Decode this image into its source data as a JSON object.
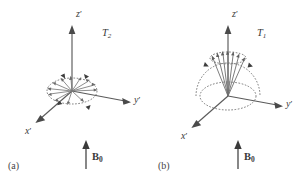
{
  "figure": {
    "width": 308,
    "height": 184,
    "background": "#ffffff",
    "ink_color": "#4a4a4a"
  },
  "panels": [
    {
      "id": "a",
      "panel_label": "(a)",
      "relaxation_label": "T",
      "relaxation_subscript": "2",
      "field_label": "B",
      "field_subscript": "0",
      "axes": [
        {
          "name": "z-prime",
          "base": "z",
          "prime": "′"
        },
        {
          "name": "y-prime",
          "base": "y",
          "prime": "′"
        },
        {
          "name": "x-prime",
          "base": "x",
          "prime": "′"
        }
      ],
      "description": "Transverse dephasing: spin isochromats fanned out in the x'y' plane inside a dashed ellipse, with curved rotation arrowheads on the ellipse rim.",
      "spin_count": 12,
      "rotation_arrowheads": 4
    },
    {
      "id": "b",
      "panel_label": "(b)",
      "relaxation_label": "T",
      "relaxation_subscript": "1",
      "field_label": "B",
      "field_subscript": "0",
      "axes": [
        {
          "name": "z-prime",
          "base": "z",
          "prime": "′"
        },
        {
          "name": "y-prime",
          "base": "y",
          "prime": "′"
        },
        {
          "name": "x-prime",
          "base": "x",
          "prime": "′"
        }
      ],
      "description": "Longitudinal recovery: bundle of spin vectors collapsing into a cone about z', dashed base ellipse and dashed upper arc with inward arrowheads.",
      "spin_count": 7,
      "rotation_arrowheads": 2
    }
  ]
}
